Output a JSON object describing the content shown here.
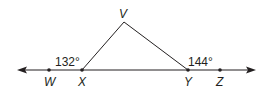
{
  "diagram": {
    "points": {
      "V": {
        "label": "V",
        "x": 124,
        "y": 22
      },
      "W": {
        "label": "W",
        "x": 49,
        "y": 70
      },
      "X": {
        "label": "X",
        "x": 82,
        "y": 70
      },
      "Y": {
        "label": "Y",
        "x": 188,
        "y": 70
      },
      "Z": {
        "label": "Z",
        "x": 220,
        "y": 70
      }
    },
    "angles": {
      "WXV": "132°",
      "VYZ": "144°"
    },
    "colors": {
      "stroke": "#231f20"
    }
  }
}
